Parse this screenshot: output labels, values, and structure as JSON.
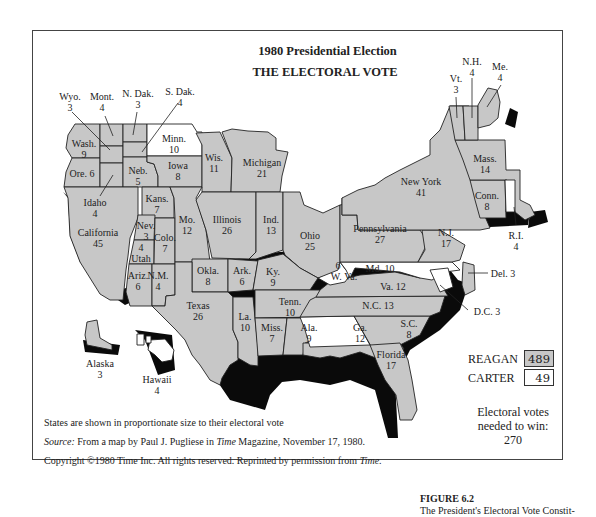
{
  "figure": {
    "title_line1": "1980 Presidential Election",
    "title_line2": "THE ELECTORAL VOTE",
    "caption_label": "FIGURE 6.2",
    "caption_text": "The President's Electoral Vote Constit-"
  },
  "legend": {
    "reagan_label": "REAGAN",
    "reagan_votes": "489",
    "reagan_color": "#c7c7c7",
    "carter_label": "CARTER",
    "carter_votes": "49",
    "carter_color": "#ffffff"
  },
  "needed": {
    "line1": "Electoral votes",
    "line2": "needed to win:",
    "value": "270"
  },
  "notes": {
    "proportion": "States are shown in proportionate size to their electoral vote",
    "source_label": "Source:",
    "source_text_a": " From a map by Paul J. Pugliese in ",
    "source_time": "Time",
    "source_text_b": " Magazine, November 17, 1980.",
    "copyright_a": "Copyright ©1980 Time Inc. All rights reserved. Reprinted by permission from ",
    "copyright_time": "Time",
    "copyright_end": "."
  },
  "states": [
    {
      "name": "Wyo.",
      "votes": "3",
      "winner": "Reagan"
    },
    {
      "name": "Mont.",
      "votes": "4",
      "winner": "Reagan"
    },
    {
      "name": "N. Dak.",
      "votes": "3",
      "winner": "Reagan"
    },
    {
      "name": "S. Dak.",
      "votes": "4",
      "winner": "Reagan"
    },
    {
      "name": "Wash.",
      "votes": "9",
      "winner": "Reagan"
    },
    {
      "name": "Minn.",
      "votes": "10",
      "winner": "Carter"
    },
    {
      "name": "Ore.",
      "votes": "6",
      "winner": "Reagan"
    },
    {
      "name": "Neb.",
      "votes": "5",
      "winner": "Reagan"
    },
    {
      "name": "Iowa",
      "votes": "8",
      "winner": "Reagan"
    },
    {
      "name": "Wis.",
      "votes": "11",
      "winner": "Reagan"
    },
    {
      "name": "Michigan",
      "votes": "21",
      "winner": "Reagan"
    },
    {
      "name": "Idaho",
      "votes": "4",
      "winner": "Reagan"
    },
    {
      "name": "Kans.",
      "votes": "7",
      "winner": "Reagan"
    },
    {
      "name": "California",
      "votes": "45",
      "winner": "Reagan"
    },
    {
      "name": "Nev.",
      "votes": "3",
      "winner": "Reagan"
    },
    {
      "name": "Utah",
      "votes": "4",
      "winner": "Reagan"
    },
    {
      "name": "Colo.",
      "votes": "7",
      "winner": "Reagan"
    },
    {
      "name": "Mo.",
      "votes": "12",
      "winner": "Reagan"
    },
    {
      "name": "Illinois",
      "votes": "26",
      "winner": "Reagan"
    },
    {
      "name": "Ind.",
      "votes": "13",
      "winner": "Reagan"
    },
    {
      "name": "Ohio",
      "votes": "25",
      "winner": "Reagan"
    },
    {
      "name": "Ariz.",
      "votes": "6",
      "winner": "Reagan"
    },
    {
      "name": "N.M.",
      "votes": "4",
      "winner": "Reagan"
    },
    {
      "name": "Okla.",
      "votes": "8",
      "winner": "Reagan"
    },
    {
      "name": "Ark.",
      "votes": "6",
      "winner": "Reagan"
    },
    {
      "name": "Ky.",
      "votes": "9",
      "winner": "Reagan"
    },
    {
      "name": "Texas",
      "votes": "26",
      "winner": "Reagan"
    },
    {
      "name": "La.",
      "votes": "10",
      "winner": "Reagan"
    },
    {
      "name": "Tenn.",
      "votes": "10",
      "winner": "Reagan"
    },
    {
      "name": "Miss.",
      "votes": "7",
      "winner": "Reagan"
    },
    {
      "name": "Ala.",
      "votes": "9",
      "winner": "Reagan"
    },
    {
      "name": "Ga.",
      "votes": "12",
      "winner": "Carter"
    },
    {
      "name": "S.C.",
      "votes": "8",
      "winner": "Reagan"
    },
    {
      "name": "Florida",
      "votes": "17",
      "winner": "Reagan"
    },
    {
      "name": "N.C.",
      "votes": "13",
      "winner": "Reagan"
    },
    {
      "name": "Va.",
      "votes": "12",
      "winner": "Reagan"
    },
    {
      "name": "W. Va.",
      "votes": "6",
      "winner": "Carter"
    },
    {
      "name": "Md.",
      "votes": "10",
      "winner": "Carter"
    },
    {
      "name": "D.C.",
      "votes": "3",
      "winner": "Carter"
    },
    {
      "name": "Del.",
      "votes": "3",
      "winner": "Reagan"
    },
    {
      "name": "Pennsylvania",
      "votes": "27",
      "winner": "Reagan"
    },
    {
      "name": "N.J.",
      "votes": "17",
      "winner": "Reagan"
    },
    {
      "name": "New York",
      "votes": "41",
      "winner": "Reagan"
    },
    {
      "name": "Conn.",
      "votes": "8",
      "winner": "Reagan"
    },
    {
      "name": "R.I.",
      "votes": "4",
      "winner": "Carter"
    },
    {
      "name": "Mass.",
      "votes": "14",
      "winner": "Reagan"
    },
    {
      "name": "Vt.",
      "votes": "3",
      "winner": "Reagan"
    },
    {
      "name": "N.H.",
      "votes": "4",
      "winner": "Reagan"
    },
    {
      "name": "Me.",
      "votes": "4",
      "winner": "Reagan"
    },
    {
      "name": "Alaska",
      "votes": "3",
      "winner": "Reagan"
    },
    {
      "name": "Hawaii",
      "votes": "4",
      "winner": "Carter"
    }
  ]
}
